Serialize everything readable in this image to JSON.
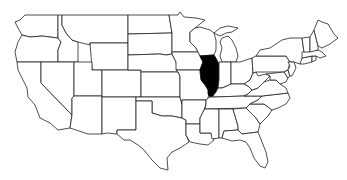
{
  "map": {
    "title": "United States",
    "highlighted_state": "Illinois",
    "colors": {
      "background": "#ffffff",
      "state_fill": "#ffffff",
      "state_stroke": "#222222",
      "highlight_fill": "#000000"
    },
    "states": [
      "Washington",
      "Oregon",
      "California",
      "Idaho",
      "Nevada",
      "Montana",
      "Wyoming",
      "Utah",
      "Arizona",
      "Colorado",
      "New Mexico",
      "North Dakota",
      "South Dakota",
      "Nebraska",
      "Kansas",
      "Oklahoma",
      "Texas",
      "Minnesota",
      "Iowa",
      "Missouri",
      "Arkansas",
      "Louisiana",
      "Wisconsin",
      "Illinois",
      "Michigan",
      "Indiana",
      "Ohio",
      "Kentucky",
      "Tennessee",
      "Mississippi",
      "Alabama",
      "Georgia",
      "Florida",
      "South Carolina",
      "North Carolina",
      "Virginia",
      "West Virginia",
      "Pennsylvania",
      "New York",
      "Maryland",
      "Delaware",
      "New Jersey",
      "Connecticut",
      "Rhode Island",
      "Massachusetts",
      "Vermont",
      "New Hampshire",
      "Maine"
    ]
  }
}
